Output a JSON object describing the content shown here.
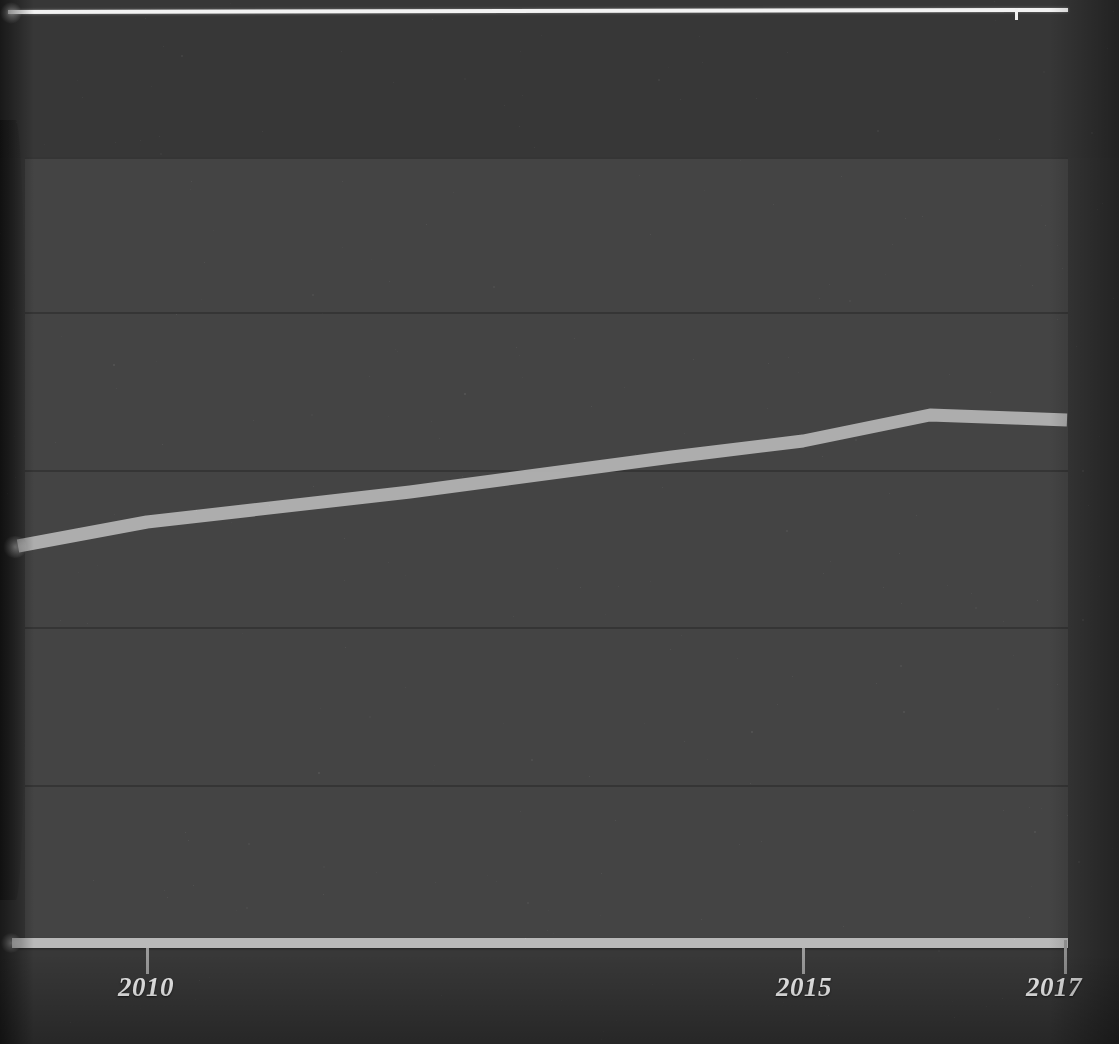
{
  "chart_data": {
    "type": "line",
    "title": "",
    "subtitle": "",
    "xlabel": "",
    "ylabel": "",
    "x": [
      2009,
      2010,
      2011,
      2012,
      2013,
      2014,
      2015,
      2016,
      2017
    ],
    "series": [
      {
        "name": "series-1",
        "color": "#b5b5b5",
        "values": [
          2.54,
          2.69,
          2.83,
          2.96,
          3.09,
          3.23,
          3.19,
          3.36,
          3.33
        ]
      }
    ],
    "x_ticks": [
      {
        "value": 2009,
        "label": "",
        "x_px": 16,
        "shown": false
      },
      {
        "value": 2010,
        "label": "2010",
        "x_px": 147,
        "shown": true
      },
      {
        "value": 2015,
        "label": "2015",
        "x_px": 803,
        "shown": true
      },
      {
        "value": 2017,
        "label": "2017",
        "x_px": 1065,
        "shown": true
      }
    ],
    "y_gridlines_px": [
      157,
      312,
      470,
      627,
      785,
      945
    ],
    "xlim": [
      2009,
      2017
    ],
    "grid": true,
    "legend": "none",
    "axis_baseline_color": "#b9b9b9",
    "plot_background": "#444444",
    "page_background": "#383838",
    "line_points_px": [
      {
        "x": 18,
        "y": 546
      },
      {
        "x": 147,
        "y": 522
      },
      {
        "x": 410,
        "y": 492
      },
      {
        "x": 672,
        "y": 457
      },
      {
        "x": 803,
        "y": 441
      },
      {
        "x": 930,
        "y": 415
      },
      {
        "x": 1067,
        "y": 420
      }
    ]
  },
  "axis": {
    "tick_labels": [
      "2010",
      "2015",
      "2017"
    ]
  },
  "decor": {
    "top_rule_note": "white rule belonging to the chart above, clipped at image top"
  }
}
